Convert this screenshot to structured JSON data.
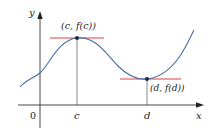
{
  "figure": {
    "axes": {
      "x_label": "x",
      "y_label": "y",
      "origin_label": "0"
    },
    "ticks": {
      "c_label": "c",
      "d_label": "d"
    },
    "points": {
      "max_label": "(c, f(c))",
      "min_label": "(d, f(d))"
    },
    "colors": {
      "curve": "#4a6fa5",
      "tangent": "#e0433e",
      "axis": "#333333",
      "point": "#1a2a40"
    }
  }
}
